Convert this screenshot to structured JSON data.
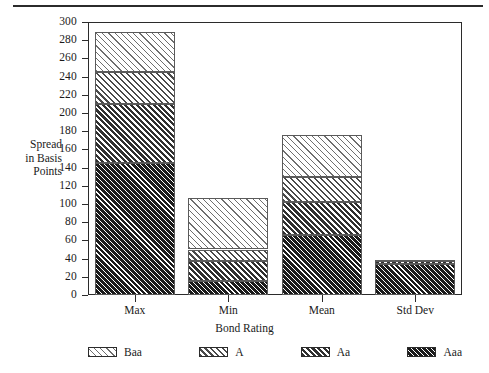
{
  "chart_data": {
    "type": "bar",
    "subtype": "stacked-bar",
    "title": "",
    "xlabel": "Bond Rating",
    "ylabel": "Spread in Basis Points",
    "ylabel_lines": [
      "Spread",
      "in Basis",
      "Points"
    ],
    "categories": [
      "Max",
      "Min",
      "Mean",
      "Std Dev"
    ],
    "series": [
      {
        "name": "Aaa",
        "values": [
          145,
          15,
          66,
          34
        ]
      },
      {
        "name": "Aa",
        "values": [
          65,
          22,
          36,
          3
        ]
      },
      {
        "name": "A",
        "values": [
          35,
          13,
          28,
          1
        ]
      },
      {
        "name": "Baa",
        "values": [
          44,
          57,
          46,
          1
        ]
      }
    ],
    "stack_order_bottom_to_top": [
      "Aaa",
      "Aa",
      "A",
      "Baa"
    ],
    "cumulative_tops": {
      "Max": [
        145,
        210,
        245,
        289
      ],
      "Min": [
        15,
        37,
        50,
        107
      ],
      "Mean": [
        66,
        102,
        130,
        176
      ],
      "Std Dev": [
        34,
        37,
        38,
        39
      ]
    },
    "totals": [
      289,
      107,
      176,
      39
    ],
    "ylim": [
      0,
      300
    ],
    "ytick_values": [
      0,
      20,
      40,
      60,
      80,
      100,
      120,
      140,
      160,
      180,
      200,
      220,
      240,
      260,
      280,
      300
    ],
    "ytick_labels": [
      "0",
      "20",
      "40",
      "60",
      "80",
      "100",
      "120",
      "140",
      "160",
      "180",
      "200",
      "220",
      "240",
      "260",
      "280",
      "300"
    ],
    "grid": false,
    "legend_position": "bottom",
    "legend": [
      {
        "label": "Baa",
        "pattern": "light-diagonal-hatch"
      },
      {
        "label": "A",
        "pattern": "medium-diagonal-hatch"
      },
      {
        "label": "Aa",
        "pattern": "dense-diagonal-hatch"
      },
      {
        "label": "Aaa",
        "pattern": "solid-dark-diagonal-hatch"
      }
    ],
    "colors": {
      "axis": "#2b2b2b",
      "text": "#1a1a1a",
      "background": "#ffffff",
      "Baa": "#e8e8e8",
      "A": "#bdbdbd",
      "Aa": "#7a7a7a",
      "Aaa": "#1c1c1c"
    }
  }
}
